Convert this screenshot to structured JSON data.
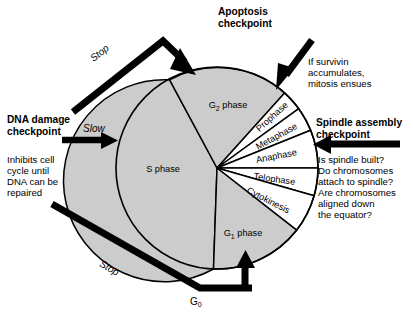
{
  "diagram": {
    "background_color": "#ffffff",
    "wedge_fill_major": "#cccccc",
    "wedge_fill_mitosis": "#ffffff",
    "stroke_color": "#000000",
    "circle": {
      "cx": 217,
      "cy": 168,
      "r": 101
    }
  },
  "phases": [
    {
      "key": "g2",
      "label": "G",
      "sub": "2",
      "suffix": " phase",
      "full": "G2 phase",
      "fill": "#cccccc"
    },
    {
      "key": "prophase",
      "label": "Prophase",
      "fill": "#ffffff"
    },
    {
      "key": "metaphase",
      "label": "Metaphase",
      "fill": "#ffffff"
    },
    {
      "key": "anaphase",
      "label": "Anaphase",
      "fill": "#ffffff"
    },
    {
      "key": "telophase",
      "label": "Telophase",
      "fill": "#ffffff"
    },
    {
      "key": "cytokinesis",
      "label": "Cytokinesis",
      "fill": "#ffffff"
    },
    {
      "key": "g1",
      "label": "G",
      "sub": "1",
      "suffix": " phase",
      "full": "G1 phase",
      "fill": "#cccccc"
    },
    {
      "key": "s",
      "label": "S phase",
      "full": "S phase",
      "fill": "#cccccc"
    }
  ],
  "checkpoints": {
    "apoptosis": {
      "title": "Apoptosis\ncheckpoint",
      "body": "If survivin\naccumulates,\nmitosis ensues"
    },
    "spindle_assembly": {
      "title": "Spindle assembly\ncheckpoint",
      "body": "Is spindle built?\nDo chromosomes\nattach to spindle?\nAre chromosomes\naligned down\nthe equator?"
    },
    "dna_damage": {
      "title": "DNA damage\ncheckpoint",
      "body": "Inhibits cell\ncycle until\nDNA can be\nrepaired"
    }
  },
  "arrow_labels": {
    "stop_top": "Stop",
    "slow": "Slow",
    "stop_bottom": "Stop",
    "g0": "G",
    "g0_sub": "0",
    "g0_full": "G0"
  }
}
